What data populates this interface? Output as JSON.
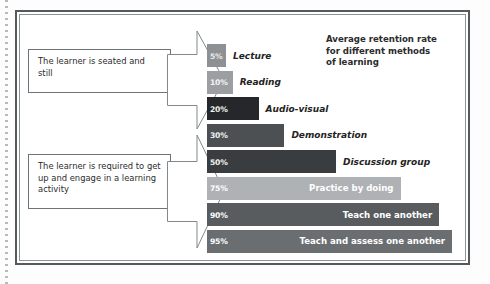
{
  "figure": {
    "title_lines": [
      "Average retention rate",
      "for different methods",
      "of learning"
    ],
    "callout_top": "The learner is seated and still",
    "callout_bottom": "The learner is required to get up and engage in a learning activity",
    "arrow_top_name": "block-arrow-passive",
    "arrow_bottom_name": "block-arrow-active"
  },
  "chart_data": {
    "type": "bar",
    "title": "Average retention rate for different methods of learning",
    "xlabel": "",
    "ylabel": "",
    "xlim": [
      0,
      100
    ],
    "grid": false,
    "orientation": "horizontal",
    "categories": [
      "Lecture",
      "Reading",
      "Audio-visual",
      "Demonstration",
      "Discussion group",
      "Practice by doing",
      "Teach one another",
      "Teach and assess one another"
    ],
    "values": [
      5,
      10,
      20,
      30,
      50,
      75,
      90,
      95
    ],
    "value_labels": [
      "5%",
      "10%",
      "20%",
      "30%",
      "50%",
      "75%",
      "90%",
      "95%"
    ],
    "bars": [
      {
        "label": "Lecture",
        "value": 5,
        "value_label": "5%",
        "color": "#8d9194",
        "pct_color": "#e9eaeb",
        "label_placement": "outside"
      },
      {
        "label": "Reading",
        "value": 10,
        "value_label": "10%",
        "color": "#9b9fa2",
        "pct_color": "#f2f3f3",
        "label_placement": "outside"
      },
      {
        "label": "Audio-visual",
        "value": 20,
        "value_label": "20%",
        "color": "#26272a",
        "pct_color": "#f2f3f3",
        "label_placement": "outside"
      },
      {
        "label": "Demonstration",
        "value": 30,
        "value_label": "30%",
        "color": "#4c5053",
        "pct_color": "#f2f3f3",
        "label_placement": "outside"
      },
      {
        "label": "Discussion group",
        "value": 50,
        "value_label": "50%",
        "color": "#3a3d40",
        "pct_color": "#f2f3f3",
        "label_placement": "outside"
      },
      {
        "label": "Practice by doing",
        "value": 75,
        "value_label": "75%",
        "color": "#aeb2b5",
        "pct_color": "#ffffff",
        "label_placement": "inside"
      },
      {
        "label": "Teach one another",
        "value": 90,
        "value_label": "90%",
        "color": "#585c5f",
        "pct_color": "#ffffff",
        "label_placement": "inside"
      },
      {
        "label": "Teach and assess one another",
        "value": 95,
        "value_label": "95%",
        "color": "#6a6e71",
        "pct_color": "#ffffff",
        "label_placement": "inside"
      }
    ]
  }
}
